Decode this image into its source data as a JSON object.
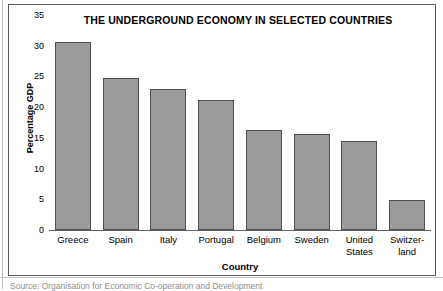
{
  "figure": {
    "frame_border_color": "#5d5d5d",
    "background": "#ffffff"
  },
  "chart_data": {
    "type": "bar",
    "title": "THE UNDERGROUND ECONOMY IN SELECTED COUNTRIES",
    "xlabel": "Country",
    "ylabel": "Percentage GDP",
    "categories": [
      "Greece",
      "Spain",
      "Italy",
      "Portugal",
      "Belgium",
      "Sweden",
      "United States",
      "Switzerland"
    ],
    "category_label_lines": [
      [
        "Greece"
      ],
      [
        "Spain"
      ],
      [
        "Italy"
      ],
      [
        "Portugal"
      ],
      [
        "Belgium"
      ],
      [
        "Sweden"
      ],
      [
        "United",
        "States"
      ],
      [
        "Switzer-",
        "land"
      ]
    ],
    "values": [
      30.6,
      24.8,
      23.0,
      21.2,
      16.3,
      15.6,
      14.5,
      4.9
    ],
    "ylim": [
      0,
      35
    ],
    "yticks": [
      0,
      5,
      10,
      15,
      20,
      25,
      30,
      35
    ],
    "ytick_labels": [
      "0",
      "5",
      "10",
      "15",
      "20",
      "25",
      "30",
      "35"
    ],
    "grid": false,
    "legend": "none",
    "bar_fill_color": "#9b9b9b",
    "bar_edge_color": "#4f4f4f"
  },
  "caption": {
    "source_text": "Source: Organisation for Economic Co-operation and Development"
  }
}
